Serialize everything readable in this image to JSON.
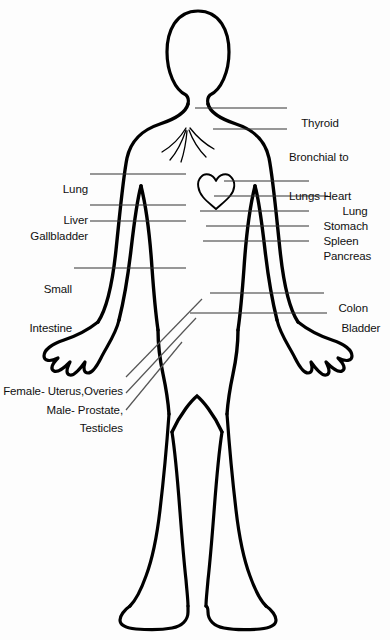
{
  "diagram": {
    "ink_color": "#000000",
    "background_color": "#fdfdfd",
    "labels_right": [
      {
        "id": "thyroid",
        "text": "Thyroid",
        "x": 289,
        "y": 104
      },
      {
        "id": "bronchial",
        "text": "Bronchial to",
        "text_line2": "Lungs",
        "x": 289,
        "y": 125
      },
      {
        "id": "heart",
        "text": "Heart",
        "x": 311,
        "y": 177
      },
      {
        "id": "lung-right",
        "text": "Lung",
        "x": 330,
        "y": 192
      },
      {
        "id": "stomach",
        "text": "Stomach",
        "x": 311,
        "y": 207
      },
      {
        "id": "spleen",
        "text": "Spleen",
        "x": 311,
        "y": 222
      },
      {
        "id": "pancreas",
        "text": "Pancreas",
        "x": 311,
        "y": 237
      },
      {
        "id": "colon",
        "text": "Colon",
        "x": 326,
        "y": 289
      },
      {
        "id": "bladder",
        "text": "Bladder",
        "x": 329,
        "y": 309
      }
    ],
    "labels_left": [
      {
        "id": "lung-left",
        "text": "Lung",
        "right": 302,
        "y": 170
      },
      {
        "id": "liver",
        "text": "Liver",
        "right": 302,
        "y": 201
      },
      {
        "id": "gallbladder",
        "text": "Gallbladder",
        "right": 302,
        "y": 217
      },
      {
        "id": "small-intestine",
        "text": "Small",
        "text_line2": "Intestine",
        "right": 318,
        "y": 257
      }
    ],
    "labels_reproductive": [
      {
        "id": "female-organs",
        "text": "Female- Uterus,Overies",
        "right": 267,
        "y": 372
      },
      {
        "id": "male-organs",
        "text": "Male- Prostate,",
        "right": 267,
        "y": 391
      },
      {
        "id": "testicles",
        "text": "Testicles",
        "right": 267,
        "y": 409
      }
    ]
  }
}
